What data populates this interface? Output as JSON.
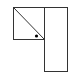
{
  "diagram": {
    "canvas": {
      "width": 71,
      "height": 73,
      "background": "#ffffff"
    },
    "stroke_color": "#333333",
    "stroke_width": 1,
    "shapes": {
      "square": {
        "x": 13.5,
        "y": 7.5,
        "width": 31,
        "height": 32
      },
      "diagonal": {
        "x1": 13.5,
        "y1": 7.5,
        "x2": 44.5,
        "y2": 39.5
      },
      "tall_rect": {
        "x": 44.5,
        "y": 7.5,
        "width": 23,
        "height": 64
      },
      "dot": {
        "cx": 36.5,
        "cy": 36,
        "r": 1.6,
        "fill": "#000000"
      }
    }
  }
}
